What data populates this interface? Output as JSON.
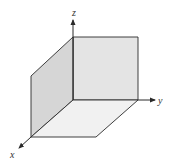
{
  "diagram": {
    "axes": {
      "x": {
        "label": "x"
      },
      "y": {
        "label": "y"
      },
      "z": {
        "label": "z"
      }
    },
    "planes": [
      {
        "name": "yz-plane",
        "color": "#e4e4e4"
      },
      {
        "name": "xz-plane",
        "color": "#d6d6d6"
      },
      {
        "name": "xy-plane",
        "color": "#f1f1f1"
      }
    ],
    "colors": {
      "line": "#2a2a2a",
      "background": "#ffffff"
    }
  }
}
